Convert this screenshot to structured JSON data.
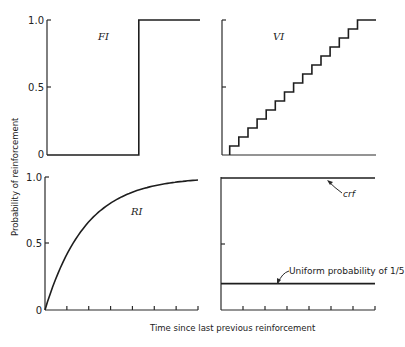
{
  "chart_data": [
    {
      "type": "line",
      "panel": "top-left",
      "label": "FI",
      "ylim": [
        0,
        1
      ],
      "yticks": [
        "0",
        "0.5",
        "1.0"
      ],
      "x_range": [
        0,
        1
      ],
      "description": "Fixed interval: probability 0 until the interval elapses, then 1",
      "step_at": 0.6,
      "series": [
        {
          "name": "FI",
          "points": [
            [
              0,
              0
            ],
            [
              0.6,
              0
            ],
            [
              0.6,
              1
            ],
            [
              1,
              1
            ]
          ]
        }
      ]
    },
    {
      "type": "line",
      "panel": "top-right",
      "label": "VI",
      "ylim": [
        0,
        1
      ],
      "yticks": [
        "",
        "",
        ""
      ],
      "x_range": [
        0,
        1
      ],
      "description": "Variable interval: staircase rising in equal steps",
      "steps": 15,
      "step_start": 0.05,
      "step_end": 0.88
    },
    {
      "type": "line",
      "panel": "bottom-left",
      "label": "RI",
      "ylim": [
        0,
        1
      ],
      "yticks": [
        "0",
        "0.5",
        "1.0"
      ],
      "x_range": [
        0,
        1
      ],
      "xtick_count": 7,
      "description": "Random interval: 1 - exp(-k t)",
      "rate_k": 3.8
    },
    {
      "type": "line",
      "panel": "bottom-right",
      "ylim": [
        0,
        1
      ],
      "yticks": [
        "",
        "",
        ""
      ],
      "x_range": [
        0,
        1
      ],
      "xtick_count": 7,
      "series": [
        {
          "name": "crf",
          "value": 1.0
        },
        {
          "name": "Uniform probability of 1/5",
          "value": 0.2
        }
      ],
      "annotations": [
        {
          "text": "crf",
          "target": "crf",
          "at_x": 0.6
        },
        {
          "text": "Uniform probability of 1/5",
          "target": "Uniform probability of 1/5",
          "at_x": 0.35
        }
      ]
    }
  ],
  "figure": {
    "ylabel": "Probability of reinforcement",
    "xlabel": "Time since last previous reinforcement"
  },
  "labels": {
    "fi": "FI",
    "vi": "VI",
    "ri": "RI",
    "crf": "crf",
    "uniform": "Uniform probability of 1/5",
    "tick_1": "1.0",
    "tick_05": "0.5",
    "tick_0": "0"
  }
}
